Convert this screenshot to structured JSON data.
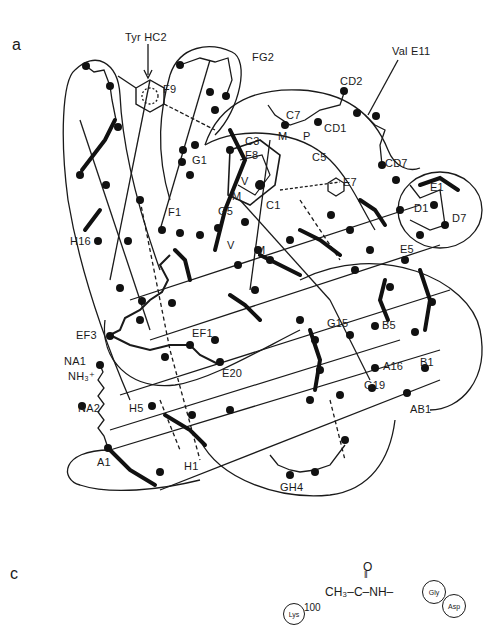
{
  "figure": {
    "panel_a": {
      "letter": "a",
      "title_annotations": {
        "tyr_hc2": "Tyr HC2",
        "val_e11": "Val E11"
      },
      "residue_labels": [
        {
          "id": "F9",
          "text": "F9"
        },
        {
          "id": "FG2",
          "text": "FG2"
        },
        {
          "id": "CD2",
          "text": "CD2"
        },
        {
          "id": "CD1",
          "text": "CD1"
        },
        {
          "id": "C7",
          "text": "C7"
        },
        {
          "id": "C3",
          "text": "C3"
        },
        {
          "id": "C5",
          "text": "C5"
        },
        {
          "id": "F8",
          "text": "F8"
        },
        {
          "id": "G1",
          "text": "G1"
        },
        {
          "id": "F1",
          "text": "F1"
        },
        {
          "id": "G5",
          "text": "G5"
        },
        {
          "id": "V1",
          "text": "V"
        },
        {
          "id": "M1",
          "text": "M"
        },
        {
          "id": "M2",
          "text": "M"
        },
        {
          "id": "M3",
          "text": "M"
        },
        {
          "id": "V2",
          "text": "V"
        },
        {
          "id": "P",
          "text": "P"
        },
        {
          "id": "C1",
          "text": "C1"
        },
        {
          "id": "E7",
          "text": "E7"
        },
        {
          "id": "CD7",
          "text": "CD7"
        },
        {
          "id": "E1",
          "text": "E1"
        },
        {
          "id": "D1",
          "text": "D1"
        },
        {
          "id": "D7",
          "text": "D7"
        },
        {
          "id": "E5",
          "text": "E5"
        },
        {
          "id": "H16",
          "text": "H16"
        },
        {
          "id": "G15",
          "text": "G15"
        },
        {
          "id": "B5",
          "text": "B5"
        },
        {
          "id": "EF3",
          "text": "EF3"
        },
        {
          "id": "EF1",
          "text": "EF1"
        },
        {
          "id": "B1",
          "text": "B1"
        },
        {
          "id": "A16",
          "text": "A16"
        },
        {
          "id": "NA1",
          "text": "NA1"
        },
        {
          "id": "NH3",
          "text": "NH₃⁺"
        },
        {
          "id": "E20",
          "text": "E20"
        },
        {
          "id": "G19",
          "text": "G19"
        },
        {
          "id": "AB1",
          "text": "AB1"
        },
        {
          "id": "NA2",
          "text": "NA2"
        },
        {
          "id": "H5",
          "text": "H5"
        },
        {
          "id": "A1",
          "text": "A1"
        },
        {
          "id": "H1",
          "text": "H1"
        },
        {
          "id": "GH4",
          "text": "GH4"
        }
      ]
    },
    "panel_c": {
      "letter": "c",
      "formula": {
        "carbonyl_o": "O",
        "double_bond": "‖",
        "chain": "CH₃–C–NH–",
        "residues": [
          "Gly",
          "Asp",
          "Lys"
        ],
        "residue_number": "100"
      }
    },
    "colors": {
      "ink": "#1a1a1a",
      "background": "#ffffff"
    }
  }
}
